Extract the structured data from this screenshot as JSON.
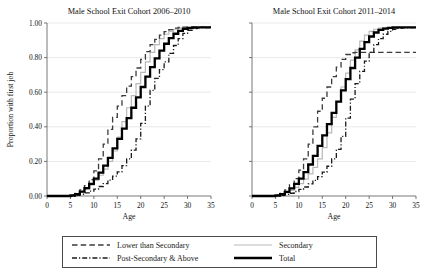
{
  "figure": {
    "y_axis_label": "Proportion with first job",
    "x_axis_label": "Age"
  },
  "legend": {
    "entries": [
      {
        "label": "Lower than Secondary",
        "style": "dashed",
        "color": "#3b3b3b",
        "width": 1.3
      },
      {
        "label": "Secondary",
        "style": "solid",
        "color": "#b9b9b9",
        "width": 1.2
      },
      {
        "label": "Post-Secondary & Above",
        "style": "dashdot",
        "color": "#1a1a1a",
        "width": 1.3
      },
      {
        "label": "Total",
        "style": "solid",
        "color": "#000000",
        "width": 2.3
      }
    ]
  },
  "chart_data": [
    {
      "type": "line",
      "title": "Male School Exit Cohort 2006–2010",
      "xlabel": "Age",
      "ylabel": "Proportion with first job",
      "xlim": [
        0,
        35
      ],
      "ylim": [
        0.0,
        1.0
      ],
      "xticks": [
        0,
        5,
        10,
        15,
        20,
        25,
        30,
        35
      ],
      "yticks": [
        0.0,
        0.2,
        0.4,
        0.6,
        0.8,
        1.0
      ],
      "ytick_labels": [
        "0.00",
        "0.20",
        "0.40",
        "0.60",
        "0.80",
        "1.00"
      ],
      "grid": "horizontal",
      "legend_position": "below-figure",
      "step_style": "post",
      "x": [
        0,
        1,
        2,
        3,
        4,
        5,
        6,
        7,
        8,
        9,
        10,
        11,
        12,
        13,
        14,
        15,
        16,
        17,
        18,
        19,
        20,
        21,
        22,
        23,
        24,
        25,
        26,
        27,
        28,
        29,
        30,
        31,
        32,
        33,
        34,
        35
      ],
      "series": [
        {
          "name": "Lower than Secondary",
          "values": [
            0,
            0,
            0,
            0,
            0,
            0.005,
            0.015,
            0.035,
            0.06,
            0.095,
            0.145,
            0.215,
            0.3,
            0.385,
            0.455,
            0.52,
            0.58,
            0.635,
            0.69,
            0.74,
            0.79,
            0.835,
            0.875,
            0.905,
            0.93,
            0.95,
            0.962,
            0.97,
            0.974,
            0.976,
            0.976,
            0.976,
            0.976,
            0.976,
            0.976,
            0.976
          ]
        },
        {
          "name": "Secondary",
          "values": [
            0,
            0,
            0,
            0,
            0,
            0.003,
            0.01,
            0.022,
            0.04,
            0.062,
            0.09,
            0.12,
            0.155,
            0.2,
            0.26,
            0.34,
            0.43,
            0.51,
            0.58,
            0.65,
            0.715,
            0.775,
            0.83,
            0.875,
            0.91,
            0.935,
            0.952,
            0.964,
            0.97,
            0.973,
            0.974,
            0.974,
            0.974,
            0.974,
            0.974,
            0.974
          ]
        },
        {
          "name": "Post-Secondary & Above",
          "values": [
            0,
            0,
            0,
            0,
            0,
            0.001,
            0.004,
            0.01,
            0.018,
            0.028,
            0.04,
            0.055,
            0.072,
            0.092,
            0.115,
            0.14,
            0.175,
            0.215,
            0.265,
            0.33,
            0.42,
            0.52,
            0.61,
            0.68,
            0.73,
            0.775,
            0.825,
            0.87,
            0.91,
            0.94,
            0.958,
            0.968,
            0.972,
            0.974,
            0.974,
            0.974
          ]
        },
        {
          "name": "Total",
          "values": [
            0,
            0,
            0,
            0,
            0,
            0.003,
            0.01,
            0.025,
            0.045,
            0.07,
            0.1,
            0.135,
            0.175,
            0.22,
            0.275,
            0.33,
            0.39,
            0.45,
            0.51,
            0.57,
            0.63,
            0.69,
            0.745,
            0.795,
            0.84,
            0.88,
            0.912,
            0.938,
            0.955,
            0.966,
            0.972,
            0.974,
            0.975,
            0.975,
            0.975,
            0.975
          ]
        }
      ]
    },
    {
      "type": "line",
      "title": "Male School Exit Cohort 2011–2014",
      "xlabel": "Age",
      "ylabel": "Proportion with first job",
      "xlim": [
        0,
        35
      ],
      "ylim": [
        0.0,
        1.0
      ],
      "xticks": [
        0,
        5,
        10,
        15,
        20,
        25,
        30,
        35
      ],
      "yticks": [
        0.0,
        0.2,
        0.4,
        0.6,
        0.8,
        1.0
      ],
      "ytick_labels": [
        "0.00",
        "0.20",
        "0.40",
        "0.60",
        "0.80",
        "1.00"
      ],
      "grid": "horizontal",
      "legend_position": "below-figure",
      "step_style": "post",
      "x": [
        0,
        1,
        2,
        3,
        4,
        5,
        6,
        7,
        8,
        9,
        10,
        11,
        12,
        13,
        14,
        15,
        16,
        17,
        18,
        19,
        20,
        21,
        22,
        23,
        24,
        25,
        26,
        27,
        28,
        29,
        30,
        31,
        32,
        33,
        34,
        35
      ],
      "series": [
        {
          "name": "Lower than Secondary",
          "values": [
            0,
            0,
            0,
            0,
            0,
            0.005,
            0.015,
            0.035,
            0.065,
            0.1,
            0.15,
            0.215,
            0.3,
            0.4,
            0.49,
            0.565,
            0.63,
            0.69,
            0.745,
            0.79,
            0.818,
            0.828,
            0.83,
            0.83,
            0.83,
            0.83,
            0.83,
            0.83,
            0.83,
            0.83,
            0.83,
            0.83,
            0.83,
            0.83,
            0.83,
            0.83
          ]
        },
        {
          "name": "Secondary",
          "values": [
            0,
            0,
            0,
            0,
            0,
            0.002,
            0.008,
            0.018,
            0.032,
            0.05,
            0.072,
            0.098,
            0.128,
            0.165,
            0.215,
            0.28,
            0.365,
            0.455,
            0.545,
            0.63,
            0.71,
            0.785,
            0.845,
            0.895,
            0.93,
            0.952,
            0.964,
            0.97,
            0.973,
            0.974,
            0.974,
            0.974,
            0.974,
            0.974,
            0.974,
            0.974
          ]
        },
        {
          "name": "Post-Secondary & Above",
          "values": [
            0,
            0,
            0,
            0,
            0,
            0.001,
            0.004,
            0.009,
            0.016,
            0.026,
            0.038,
            0.052,
            0.07,
            0.09,
            0.112,
            0.138,
            0.172,
            0.215,
            0.27,
            0.345,
            0.45,
            0.56,
            0.65,
            0.72,
            0.78,
            0.83,
            0.875,
            0.91,
            0.935,
            0.952,
            0.963,
            0.969,
            0.972,
            0.973,
            0.973,
            0.973
          ]
        },
        {
          "name": "Total",
          "values": [
            0,
            0,
            0,
            0,
            0,
            0.003,
            0.01,
            0.024,
            0.044,
            0.07,
            0.1,
            0.138,
            0.182,
            0.232,
            0.29,
            0.35,
            0.415,
            0.48,
            0.545,
            0.61,
            0.675,
            0.74,
            0.8,
            0.85,
            0.89,
            0.922,
            0.945,
            0.96,
            0.968,
            0.972,
            0.974,
            0.975,
            0.975,
            0.975,
            0.975,
            0.975
          ]
        }
      ]
    }
  ]
}
